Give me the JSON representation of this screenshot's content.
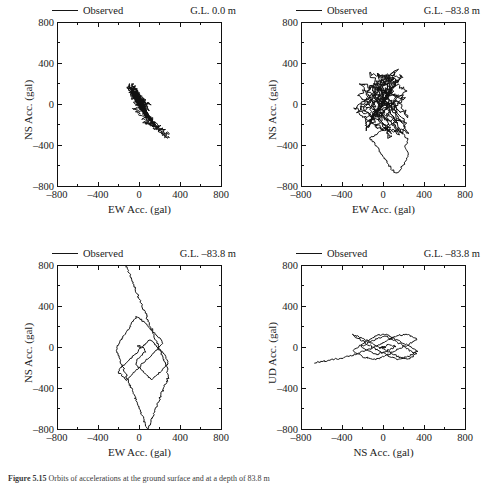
{
  "figure": {
    "caption_label": "Figure 5.15",
    "caption_text": "Orbits of accelerations at the ground surface and at a depth of 83.8 m",
    "legend_label": "Observed",
    "axis_ticks": [
      800,
      400,
      0,
      -400,
      -800
    ],
    "tick_labels": [
      "800",
      "400",
      "0",
      "–400",
      "–800"
    ],
    "line_color": "#111111"
  },
  "panels": [
    {
      "id": "top-left",
      "depth_note": "G.L.  0.0 m",
      "legend_label": "Observed",
      "xlabel": "EW Acc. (gal)",
      "ylabel": "NS Acc. (gal)"
    },
    {
      "id": "top-right",
      "depth_note": "G.L. –83.8 m",
      "legend_label": "Observed",
      "xlabel": "EW Acc. (gal)",
      "ylabel": "NS Acc. (gal)"
    },
    {
      "id": "bottom-left",
      "depth_note": "G.L. –83.8 m",
      "legend_label": "Observed",
      "xlabel": "EW Acc. (gal)",
      "ylabel": "NS Acc. (gal)"
    },
    {
      "id": "bottom-right",
      "depth_note": "G.L. –83.8 m",
      "legend_label": "Observed",
      "xlabel": "NS Acc. (gal)",
      "ylabel": "UD Acc. (gal)"
    }
  ],
  "chart_data": [
    {
      "type": "line",
      "panel": "top-left",
      "title": "G.L. 0.0 m",
      "xlabel": "EW Acc. (gal)",
      "ylabel": "NS Acc. (gal)",
      "xlim": [
        -800,
        800
      ],
      "ylim": [
        -800,
        800
      ],
      "xticks": [
        -800,
        -400,
        0,
        400,
        800
      ],
      "yticks": [
        -800,
        -400,
        0,
        400,
        800
      ],
      "grid": false,
      "legend": [
        "Observed"
      ],
      "legend_position": "above-left",
      "series": [
        {
          "name": "Observed",
          "comment": "Orbit trace; dense vertically-elongated cluster near origin spanning roughly EW -120..160, NS -230..210, with a lower-right excursion lobe reaching about EW 300, NS -330.",
          "x": [
            0,
            -20,
            30,
            -45,
            60,
            -30,
            80,
            -60,
            40,
            -80,
            95,
            -50,
            120,
            -70,
            55,
            -95,
            140,
            -40,
            70,
            -110,
            160,
            -25,
            45,
            -85,
            110,
            -55,
            30,
            -100,
            150,
            -35,
            85,
            -65,
            25,
            -90,
            130,
            -45,
            60,
            -75,
            100,
            -30,
            170,
            40,
            210,
            90,
            250,
            140,
            290,
            200,
            300,
            250,
            270,
            180,
            220,
            120,
            160,
            60,
            100,
            20,
            50,
            -10,
            10,
            -40,
            35,
            -70,
            75,
            -20,
            115,
            30,
            65,
            -50,
            25,
            -85,
            55,
            -25,
            95,
            15,
            45,
            -60,
            5,
            -35,
            40,
            -15,
            20,
            0
          ],
          "y": [
            0,
            60,
            -40,
            110,
            -85,
            150,
            -120,
            185,
            35,
            205,
            -60,
            95,
            -150,
            145,
            20,
            175,
            -190,
            70,
            -105,
            160,
            -225,
            45,
            -75,
            130,
            -165,
            85,
            -30,
            190,
            -210,
            55,
            -140,
            115,
            -15,
            170,
            -180,
            75,
            -95,
            140,
            -160,
            40,
            -200,
            -175,
            -215,
            -195,
            -250,
            -235,
            -290,
            -280,
            -330,
            -320,
            -300,
            -265,
            -240,
            -215,
            -195,
            -175,
            -160,
            -140,
            -125,
            -105,
            -85,
            -70,
            -55,
            -40,
            -25,
            -10,
            5,
            20,
            35,
            50,
            30,
            65,
            45,
            25,
            15,
            5,
            -5,
            20,
            10,
            0,
            -10,
            5,
            0,
            0
          ]
        }
      ]
    },
    {
      "type": "line",
      "panel": "top-right",
      "title": "G.L. –83.8 m",
      "xlabel": "EW Acc. (gal)",
      "ylabel": "NS Acc. (gal)",
      "xlim": [
        -800,
        800
      ],
      "ylim": [
        -800,
        800
      ],
      "xticks": [
        -800,
        -400,
        0,
        400,
        800
      ],
      "yticks": [
        -800,
        -400,
        0,
        400,
        800
      ],
      "grid": false,
      "legend": [
        "Observed"
      ],
      "legend_position": "above-left",
      "series": [
        {
          "name": "Observed",
          "comment": "Dense roughly circular blob centered near the origin spanning about EW -280..250 and NS -330..330, with a long downward-right excursion to about EW 250, NS -670.",
          "x": [
            0,
            60,
            -70,
            110,
            -120,
            150,
            -160,
            90,
            -200,
            180,
            -110,
            210,
            -250,
            130,
            -180,
            230,
            -60,
            170,
            -280,
            100,
            -140,
            240,
            -90,
            190,
            -220,
            70,
            -160,
            250,
            -40,
            140,
            -260,
            80,
            -120,
            200,
            -190,
            50,
            -230,
            160,
            -80,
            220,
            180,
            240,
            210,
            250,
            230,
            190,
            150,
            110,
            70,
            30,
            -10,
            -50,
            -90,
            -130,
            -60,
            20,
            80,
            130,
            60,
            -20,
            -70,
            40,
            100,
            -40,
            30,
            -80,
            60,
            10,
            -30,
            50,
            0
          ],
          "y": [
            0,
            120,
            -90,
            200,
            -160,
            260,
            -210,
            310,
            -60,
            280,
            180,
            -300,
            90,
            330,
            -250,
            150,
            290,
            -180,
            -40,
            250,
            310,
            -270,
            -220,
            60,
            200,
            -330,
            130,
            -120,
            290,
            240,
            -70,
            -290,
            170,
            70,
            -200,
            300,
            -40,
            -310,
            250,
            -180,
            -280,
            -350,
            -420,
            -480,
            -540,
            -600,
            -660,
            -670,
            -620,
            -560,
            -500,
            -440,
            -380,
            -330,
            -280,
            -240,
            -200,
            -160,
            -120,
            -90,
            -60,
            -30,
            10,
            40,
            70,
            30,
            -10,
            20,
            -20,
            10,
            0
          ]
        }
      ]
    },
    {
      "type": "line",
      "panel": "bottom-left",
      "title": "G.L. –83.8 m",
      "xlabel": "EW Acc. (gal)",
      "ylabel": "NS Acc. (gal)",
      "xlim": [
        -800,
        800
      ],
      "ylim": [
        -800,
        800
      ],
      "xticks": [
        -800,
        -400,
        0,
        400,
        800
      ],
      "yticks": [
        -800,
        -400,
        0,
        400,
        800
      ],
      "grid": false,
      "legend": [
        "Observed"
      ],
      "legend_position": "above-left",
      "series": [
        {
          "name": "Observed",
          "comment": "A strong straight diagonal excursion runs from about EW -130, NS 800 (top edge) down through the origin to about EW 280, NS -800 (bottom edge); a moderate looping cluster sits near the origin spanning EW -230..230, NS -320..300.",
          "x": [
            -130,
            -90,
            -50,
            -10,
            30,
            70,
            110,
            150,
            190,
            230,
            270,
            280,
            240,
            200,
            160,
            120,
            80,
            40,
            0,
            -40,
            -80,
            -120,
            -160,
            -200,
            -230,
            -190,
            -150,
            -110,
            -70,
            -30,
            10,
            50,
            90,
            130,
            170,
            210,
            230,
            190,
            150,
            110,
            70,
            30,
            -10,
            -50,
            -90,
            -130,
            -170,
            -210,
            -180,
            -140,
            -100,
            -60,
            -20,
            20,
            60,
            100,
            140,
            180,
            220,
            250,
            270,
            280,
            240,
            200,
            160,
            120,
            80,
            40,
            0,
            -40,
            -20,
            20,
            60,
            40,
            0,
            -20,
            10,
            0
          ],
          "y": [
            800,
            700,
            600,
            500,
            400,
            300,
            200,
            100,
            0,
            -100,
            -200,
            -300,
            -400,
            -500,
            -600,
            -700,
            -800,
            -700,
            -600,
            -500,
            -400,
            -300,
            -200,
            -100,
            0,
            60,
            120,
            180,
            240,
            300,
            280,
            240,
            200,
            160,
            120,
            80,
            40,
            0,
            -40,
            -80,
            -120,
            -160,
            -200,
            -240,
            -280,
            -320,
            -280,
            -240,
            -200,
            -160,
            -120,
            -80,
            -40,
            0,
            40,
            80,
            40,
            0,
            -40,
            -80,
            -120,
            -160,
            -200,
            -240,
            -280,
            -320,
            -280,
            -240,
            -200,
            -160,
            -120,
            -80,
            -40,
            0,
            20,
            10,
            0,
            0
          ]
        }
      ]
    },
    {
      "type": "line",
      "panel": "bottom-right",
      "title": "G.L. –83.8 m",
      "xlabel": "NS Acc. (gal)",
      "ylabel": "UD Acc. (gal)",
      "xlim": [
        -800,
        800
      ],
      "ylim": [
        -800,
        800
      ],
      "xticks": [
        -800,
        -400,
        0,
        400,
        800
      ],
      "yticks": [
        -800,
        -400,
        0,
        400,
        800
      ],
      "grid": false,
      "legend": [
        "Observed"
      ],
      "legend_position": "above-left",
      "series": [
        {
          "name": "Observed",
          "comment": "Dense horizontally-flattened band centered slightly above the origin spanning roughly NS -300..330 and UD -120..130, with a thin tail trailing left to about NS -680, UD -150.",
          "x": [
            -680,
            -620,
            -560,
            -500,
            -440,
            -380,
            -320,
            -260,
            -200,
            -140,
            -80,
            -20,
            40,
            100,
            160,
            220,
            280,
            330,
            280,
            220,
            160,
            100,
            40,
            -20,
            -80,
            -140,
            -200,
            -260,
            -300,
            -240,
            -180,
            -120,
            -60,
            0,
            60,
            120,
            180,
            240,
            300,
            330,
            270,
            210,
            150,
            90,
            30,
            -30,
            -90,
            -150,
            -210,
            -270,
            -300,
            -250,
            -190,
            -130,
            -70,
            -10,
            50,
            110,
            170,
            230,
            290,
            320,
            260,
            200,
            140,
            80,
            20,
            -40,
            -100,
            -160,
            -220,
            -180,
            -120,
            -60,
            0,
            60,
            120,
            60,
            0,
            -40,
            20,
            0
          ],
          "y": [
            -150,
            -140,
            -130,
            -120,
            -110,
            -95,
            -80,
            -60,
            -40,
            -20,
            10,
            40,
            70,
            100,
            120,
            130,
            110,
            80,
            50,
            20,
            -10,
            -40,
            -70,
            -100,
            -120,
            -110,
            -90,
            -60,
            -30,
            10,
            50,
            90,
            120,
            130,
            110,
            80,
            50,
            20,
            -10,
            -40,
            -70,
            -100,
            -115,
            -100,
            -70,
            -40,
            -10,
            30,
            70,
            100,
            125,
            110,
            80,
            50,
            20,
            -10,
            -40,
            -70,
            -100,
            -110,
            -90,
            -60,
            -30,
            10,
            50,
            80,
            110,
            100,
            70,
            40,
            10,
            -20,
            -50,
            -70,
            -50,
            -20,
            10,
            30,
            10,
            0,
            5,
            0
          ]
        }
      ]
    }
  ]
}
